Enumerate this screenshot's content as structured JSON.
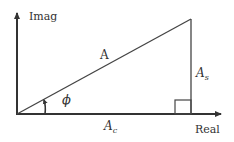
{
  "diagram": {
    "colors": {
      "line": "#333333",
      "background": "#ffffff"
    },
    "axes": {
      "vertical_label": "Imag",
      "horizontal_label": "Real"
    },
    "labels": {
      "hypotenuse": "A",
      "vertical_side_main": "A",
      "vertical_side_sub": "s",
      "horizontal_side_main": "A",
      "horizontal_side_sub": "c",
      "angle": "ϕ"
    }
  }
}
